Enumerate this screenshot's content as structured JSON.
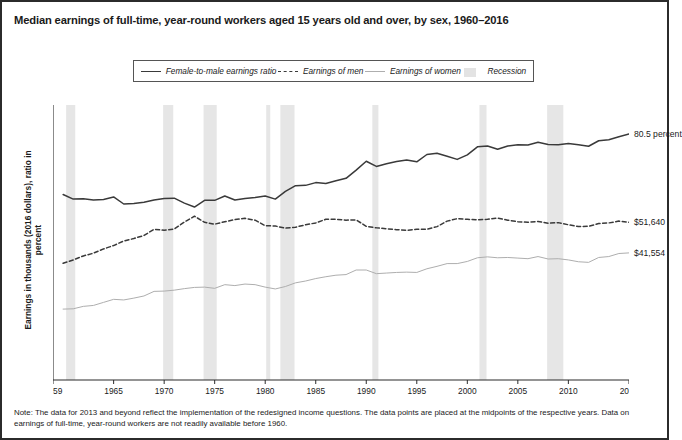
{
  "title": "Median earnings of full-time, year-round workers aged 15 years old and over, by sex, 1960–2016",
  "note": "Note: The data for 2013 and beyond reflect the implementation of the redesigned income questions. The data points are placed at the midpoints of the respective years. Data on earnings of full-time, year-round workers are not readily available before 1960.",
  "legend": {
    "items": [
      {
        "label": "Female-to-male earnings ratio",
        "style": "solid-dark",
        "color": "#3a3a3a"
      },
      {
        "label": "Earnings of men",
        "style": "dashed",
        "color": "#3a3a3a"
      },
      {
        "label": "Earnings of women",
        "style": "solid-light",
        "color": "#aeaeae"
      },
      {
        "label": "Recession",
        "style": "box",
        "color": "#e3e3e3"
      }
    ]
  },
  "end_labels": {
    "ratio": "80.5 percent",
    "men": "$51,640",
    "women": "$41,554"
  },
  "chart_data": {
    "type": "line",
    "title": "Median earnings of full-time, year-round workers aged 15 years old and over, by sex, 1960–2016",
    "xlabel": "",
    "ylabel": "Earnings in thousands (2016 dollars), ratio in percent",
    "xlim": [
      1959,
      2016
    ],
    "ylim": [
      0,
      90
    ],
    "grid": false,
    "legend_position": "top-center",
    "yticks": [
      0,
      10,
      20,
      30,
      40,
      50,
      60,
      70,
      80,
      90
    ],
    "xticks": [
      1959,
      1965,
      1970,
      1975,
      1980,
      1985,
      1990,
      1995,
      2000,
      2005,
      2010,
      2016
    ],
    "x": [
      1960,
      1961,
      1962,
      1963,
      1964,
      1965,
      1966,
      1967,
      1968,
      1969,
      1970,
      1971,
      1972,
      1973,
      1974,
      1975,
      1976,
      1977,
      1978,
      1979,
      1980,
      1981,
      1982,
      1983,
      1984,
      1985,
      1986,
      1987,
      1988,
      1989,
      1990,
      1991,
      1992,
      1993,
      1994,
      1995,
      1996,
      1997,
      1998,
      1999,
      2000,
      2001,
      2002,
      2003,
      2004,
      2005,
      2006,
      2007,
      2008,
      2009,
      2010,
      2011,
      2012,
      2013,
      2014,
      2015,
      2016
    ],
    "series": [
      {
        "name": "Female-to-male earnings ratio",
        "unit": "percent",
        "style": "solid-dark",
        "color": "#3a3a3a",
        "values": [
          60.7,
          59.2,
          59.3,
          58.9,
          59.1,
          59.9,
          57.6,
          57.8,
          58.2,
          58.9,
          59.4,
          59.5,
          57.9,
          56.6,
          58.8,
          58.8,
          60.2,
          58.9,
          59.4,
          59.7,
          60.2,
          59.2,
          61.7,
          63.6,
          63.7,
          64.6,
          64.3,
          65.2,
          66.0,
          68.7,
          71.6,
          69.9,
          70.8,
          71.5,
          72.0,
          71.4,
          73.8,
          74.2,
          73.2,
          72.2,
          73.7,
          76.3,
          76.6,
          75.5,
          76.6,
          77.0,
          76.9,
          77.8,
          77.1,
          77.0,
          77.4,
          77.0,
          76.5,
          78.3,
          78.6,
          79.6,
          80.5
        ]
      },
      {
        "name": "Earnings of men",
        "unit": "thousands of 2016 dollars",
        "style": "dashed",
        "color": "#3a3a3a",
        "values": [
          38.2,
          39.3,
          40.6,
          41.5,
          42.9,
          44.0,
          45.5,
          46.3,
          47.3,
          49.3,
          49.0,
          49.4,
          51.7,
          53.6,
          51.6,
          51.0,
          51.8,
          52.5,
          52.9,
          52.3,
          50.5,
          50.4,
          49.7,
          50.0,
          50.8,
          51.4,
          52.6,
          52.6,
          52.3,
          52.4,
          50.3,
          49.8,
          49.5,
          49.2,
          49.0,
          49.3,
          49.3,
          50.2,
          52.0,
          52.8,
          52.6,
          52.4,
          52.6,
          53.0,
          52.3,
          51.8,
          51.6,
          51.9,
          51.3,
          51.5,
          50.8,
          50.2,
          50.3,
          51.2,
          51.4,
          52.0,
          51.6
        ]
      },
      {
        "name": "Earnings of women",
        "unit": "thousands of 2016 dollars",
        "style": "solid-light",
        "color": "#aeaeae",
        "values": [
          23.2,
          23.3,
          24.1,
          24.4,
          25.4,
          26.4,
          26.2,
          26.8,
          27.5,
          29.0,
          29.1,
          29.4,
          29.9,
          30.3,
          30.4,
          30.0,
          31.2,
          30.9,
          31.4,
          31.2,
          30.4,
          29.8,
          30.6,
          31.8,
          32.4,
          33.2,
          33.8,
          34.3,
          34.5,
          36.0,
          36.0,
          34.8,
          35.0,
          35.2,
          35.3,
          35.2,
          36.4,
          37.2,
          38.1,
          38.1,
          38.8,
          40.0,
          40.3,
          40.0,
          40.1,
          39.9,
          39.7,
          40.4,
          39.6,
          39.7,
          39.3,
          38.7,
          38.5,
          40.1,
          40.4,
          41.4,
          41.6
        ]
      }
    ],
    "recessions": [
      {
        "start": 1960.3,
        "end": 1961.2
      },
      {
        "start": 1969.9,
        "end": 1970.9
      },
      {
        "start": 1973.9,
        "end": 1975.2
      },
      {
        "start": 1980.1,
        "end": 1980.5
      },
      {
        "start": 1981.5,
        "end": 1982.9
      },
      {
        "start": 1990.6,
        "end": 1991.2
      },
      {
        "start": 2001.2,
        "end": 2001.9
      },
      {
        "start": 2007.9,
        "end": 2009.5
      }
    ]
  }
}
